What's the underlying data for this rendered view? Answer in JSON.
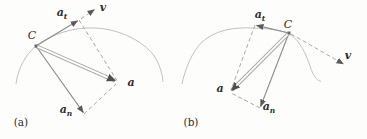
{
  "figure": {
    "background": "#fdfdfc",
    "colors": {
      "vector_stroke": "#8c8c8c",
      "arrowhead": "#5a5a5a",
      "resultant_outline": "#a9a9a9",
      "resultant_core": "#ffffff",
      "resultant_head": "#4f4f4f",
      "dashed_line": "#a8a8a8",
      "trajectory_curve": "#c2c2c2",
      "label_color": "#2e2e2e"
    },
    "panels": [
      {
        "caption": "(a)",
        "labels": {
          "point": "C",
          "tangential_main": "a",
          "tangential_sub": "t",
          "velocity": "v",
          "acceleration": "a",
          "normal_main": "a",
          "normal_sub": "n"
        }
      },
      {
        "caption": "(b)",
        "labels": {
          "point": "C",
          "tangential_main": "a",
          "tangential_sub": "t",
          "velocity": "v",
          "acceleration": "a",
          "normal_main": "a",
          "normal_sub": "n"
        }
      }
    ]
  }
}
